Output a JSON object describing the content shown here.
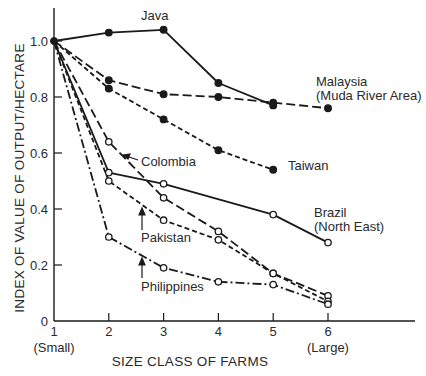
{
  "chart_data": {
    "type": "line",
    "title": "",
    "xlabel": "SIZE CLASS OF FARMS",
    "ylabel": "INDEX OF VALUE OF OUTPUT/HECTARE",
    "x": [
      1,
      2,
      3,
      4,
      5,
      6
    ],
    "x_tick_labels": [
      "1",
      "2",
      "3",
      "4",
      "5",
      "6"
    ],
    "x_tick_sublabels": {
      "1": "(Small)",
      "6": "(Large)"
    },
    "y_ticks": [
      0,
      0.2,
      0.4,
      0.6,
      0.8,
      1.0
    ],
    "y_tick_labels": [
      "0",
      "0.2",
      "0.4",
      "0.6",
      "0.8",
      "1.0"
    ],
    "xlim": [
      1,
      7
    ],
    "ylim": [
      0,
      1.1
    ],
    "grid": false,
    "legend": "inline labels next to lines",
    "series": [
      {
        "name": "Java",
        "style": "solid",
        "marker": "filled",
        "values": [
          1.0,
          1.03,
          1.04,
          0.85,
          0.77,
          null
        ]
      },
      {
        "name": "Malaysia (Muda River Area)",
        "style": "long-dash",
        "marker": "filled",
        "values": [
          1.0,
          0.86,
          0.81,
          0.8,
          0.78,
          0.76
        ]
      },
      {
        "name": "Taiwan",
        "style": "short-dash",
        "marker": "filled",
        "values": [
          1.0,
          0.83,
          0.72,
          0.61,
          0.54,
          null
        ]
      },
      {
        "name": "Colombia",
        "style": "long-dash",
        "marker": "open",
        "values": [
          1.0,
          0.64,
          0.44,
          0.32,
          0.17,
          0.09
        ]
      },
      {
        "name": "Brazil (North East)",
        "style": "solid",
        "marker": "open",
        "values": [
          1.0,
          0.53,
          0.49,
          null,
          0.38,
          0.28
        ]
      },
      {
        "name": "Pakistan",
        "style": "short-dash",
        "marker": "open",
        "values": [
          1.0,
          0.5,
          0.36,
          0.29,
          0.17,
          0.07
        ]
      },
      {
        "name": "Philippines",
        "style": "dash-dot",
        "marker": "open",
        "values": [
          1.0,
          0.3,
          0.19,
          0.14,
          0.13,
          0.06
        ]
      }
    ],
    "annotations": [
      {
        "text": "Java",
        "x": 2.6,
        "y": 1.07
      },
      {
        "text": "Malaysia",
        "x": 5.2,
        "y": 0.85
      },
      {
        "text": "(Muda River Area)",
        "x": 5.2,
        "y": 0.8
      },
      {
        "text": "Taiwan",
        "x": 5.4,
        "y": 0.55
      },
      {
        "text": "Colombia",
        "x": 2.4,
        "y": 0.56
      },
      {
        "text": "Brazil",
        "x": 5.7,
        "y": 0.39
      },
      {
        "text": "(North East)",
        "x": 5.7,
        "y": 0.34
      },
      {
        "text": "Pakistan",
        "x": 2.6,
        "y": 0.26
      },
      {
        "text": "Philippines",
        "x": 2.6,
        "y": 0.09
      }
    ],
    "colors": {
      "ink": "#1a1a1a",
      "background": "#ffffff"
    }
  },
  "labels": {
    "java": "Java",
    "malaysia_1": "Malaysia",
    "malaysia_2": "(Muda River Area)",
    "taiwan": "Taiwan",
    "colombia": "Colombia",
    "brazil_1": "Brazil",
    "brazil_2": "(North East)",
    "pakistan": "Pakistan",
    "philippines": "Philippines"
  }
}
